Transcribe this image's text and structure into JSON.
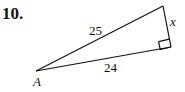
{
  "problem": {
    "number": "10."
  },
  "triangle": {
    "vertices": {
      "A": {
        "label": "A",
        "x": 36,
        "y": 71
      },
      "top": {
        "x": 163,
        "y": 6
      },
      "right_angle": {
        "x": 171,
        "y": 47
      }
    },
    "sides": {
      "hypotenuse": "25",
      "adjacent": "24",
      "opposite": "x"
    },
    "right_angle_marker": true,
    "stroke_color": "#111111"
  }
}
